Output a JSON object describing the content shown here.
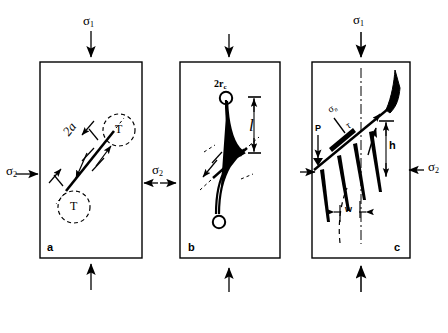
{
  "figure": {
    "type": "diagram",
    "background_color": "#ffffff",
    "ink_color": "#000000"
  },
  "stresses": {
    "sigma1_symbol": "σ",
    "sigma1_sub": "1",
    "sigma2_symbol": "σ",
    "sigma2_sub": "2",
    "sigma_n_symbol": "σ",
    "sigma_n_sub": "n",
    "tau_symbol": "τ"
  },
  "panels": [
    {
      "letter": "a",
      "name": "panel-a",
      "labels": [
        {
          "name": "crack-length-label",
          "text": "2a"
        },
        {
          "name": "tensile-zone-label-top",
          "text": "T"
        },
        {
          "name": "tensile-zone-label-bottom",
          "text": "T"
        }
      ],
      "top_stress": {
        "symbol": "σ",
        "sub": "1"
      },
      "left_stress": {
        "symbol": "σ",
        "sub": "2"
      },
      "right_stress": {
        "symbol": "σ",
        "sub": "2"
      }
    },
    {
      "letter": "b",
      "name": "panel-b",
      "labels": [
        {
          "name": "wing-tip-radius-label",
          "text": "2r",
          "sub": "c"
        },
        {
          "name": "wing-length-label",
          "text": "l"
        }
      ],
      "top_stress": {
        "symbol": "σ",
        "sub": "1"
      },
      "left_stress": {
        "symbol": "σ",
        "sub": "2"
      }
    },
    {
      "letter": "c",
      "name": "panel-c",
      "labels": [
        {
          "name": "normal-stress-label",
          "text": "σ",
          "sub": "n"
        },
        {
          "name": "shear-stress-label",
          "text": "τ"
        },
        {
          "name": "axial-load-label",
          "text": "P"
        },
        {
          "name": "slab-height-label",
          "text": "h"
        },
        {
          "name": "slab-width-label",
          "text": "w"
        }
      ],
      "top_stress": {
        "symbol": "σ",
        "sub": "1"
      },
      "right_stress": {
        "symbol": "σ",
        "sub": "2"
      }
    }
  ]
}
